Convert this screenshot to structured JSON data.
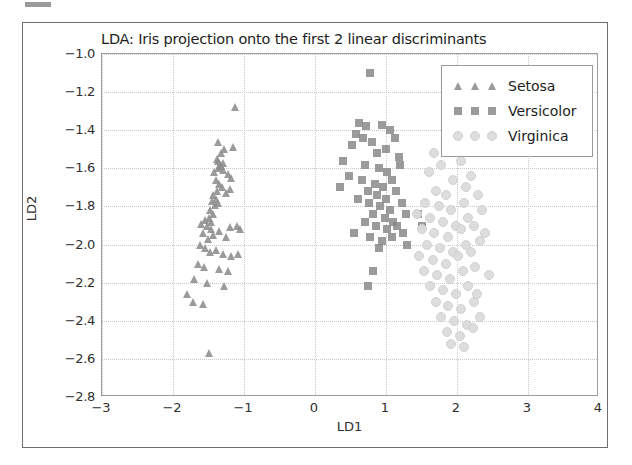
{
  "chart_data": {
    "type": "scatter",
    "title": "LDA: Iris projection onto the first 2 linear discriminants",
    "xlabel": "LD1",
    "ylabel": "LD2",
    "xlim": [
      -3,
      4
    ],
    "ylim": [
      -2.8,
      -1.0
    ],
    "xticks": [
      "-3",
      "-2",
      "-1",
      "0",
      "1",
      "2",
      "3",
      "4"
    ],
    "xtick_values": [
      -3,
      -2,
      -1,
      0,
      1,
      2,
      3,
      4
    ],
    "yticks": [
      "-1.0",
      "-1.2",
      "-1.4",
      "-1.6",
      "-1.8",
      "-2.0",
      "-2.2",
      "-2.4",
      "-2.6",
      "-2.8"
    ],
    "ytick_values": [
      -1.0,
      -1.2,
      -1.4,
      -1.6,
      -1.8,
      -2.0,
      -2.2,
      -2.4,
      -2.6,
      -2.8
    ],
    "grid": true,
    "grid_style": "dotted",
    "legend_position": "upper right",
    "series": [
      {
        "name": "Setosa",
        "marker": "triangle",
        "color": "#8d8d8d",
        "points": [
          [
            -1.33,
            -1.52
          ],
          [
            -1.28,
            -1.5
          ],
          [
            -1.15,
            -1.49
          ],
          [
            -1.38,
            -1.55
          ],
          [
            -1.36,
            -1.56
          ],
          [
            -1.3,
            -1.57
          ],
          [
            -1.34,
            -1.58
          ],
          [
            -1.32,
            -1.59
          ],
          [
            -1.37,
            -1.6
          ],
          [
            -1.29,
            -1.61
          ],
          [
            -1.22,
            -1.63
          ],
          [
            -1.18,
            -1.65
          ],
          [
            -1.42,
            -1.62
          ],
          [
            -1.4,
            -1.66
          ],
          [
            -1.35,
            -1.68
          ],
          [
            -1.31,
            -1.7
          ],
          [
            -1.38,
            -1.72
          ],
          [
            -1.43,
            -1.74
          ],
          [
            -1.39,
            -1.76
          ],
          [
            -1.45,
            -1.77
          ],
          [
            -1.41,
            -1.79
          ],
          [
            -1.36,
            -1.78
          ],
          [
            -1.26,
            -1.73
          ],
          [
            -1.2,
            -1.71
          ],
          [
            -1.48,
            -1.82
          ],
          [
            -1.44,
            -1.84
          ],
          [
            -1.5,
            -1.86
          ],
          [
            -1.46,
            -1.88
          ],
          [
            -1.52,
            -1.9
          ],
          [
            -1.47,
            -1.92
          ],
          [
            -1.55,
            -1.87
          ],
          [
            -1.6,
            -1.89
          ],
          [
            -1.43,
            -1.95
          ],
          [
            -1.51,
            -1.97
          ],
          [
            -1.58,
            -1.94
          ],
          [
            -1.35,
            -1.93
          ],
          [
            -1.2,
            -1.91
          ],
          [
            -1.1,
            -1.9
          ],
          [
            -1.05,
            -1.92
          ],
          [
            -1.25,
            -1.96
          ],
          [
            -1.62,
            -2.0
          ],
          [
            -1.55,
            -2.02
          ],
          [
            -1.48,
            -2.04
          ],
          [
            -1.4,
            -2.03
          ],
          [
            -1.3,
            -2.05
          ],
          [
            -1.18,
            -2.06
          ],
          [
            -1.08,
            -2.05
          ],
          [
            -1.65,
            -2.1
          ],
          [
            -1.57,
            -2.12
          ],
          [
            -1.35,
            -2.13
          ],
          [
            -1.22,
            -2.14
          ],
          [
            -1.7,
            -2.18
          ],
          [
            -1.52,
            -2.2
          ],
          [
            -1.28,
            -2.22
          ],
          [
            -1.8,
            -2.26
          ],
          [
            -1.72,
            -2.3
          ],
          [
            -1.58,
            -2.31
          ],
          [
            -1.12,
            -1.28
          ],
          [
            -1.5,
            -2.57
          ],
          [
            -1.36,
            -1.46
          ]
        ]
      },
      {
        "name": "Versicolor",
        "marker": "square",
        "color": "#8a8a8a",
        "points": [
          [
            0.78,
            -1.1
          ],
          [
            0.62,
            -1.36
          ],
          [
            0.72,
            -1.38
          ],
          [
            0.95,
            -1.37
          ],
          [
            0.58,
            -1.42
          ],
          [
            0.68,
            -1.44
          ],
          [
            0.8,
            -1.46
          ],
          [
            1.05,
            -1.4
          ],
          [
            1.12,
            -1.44
          ],
          [
            0.52,
            -1.48
          ],
          [
            0.88,
            -1.52
          ],
          [
            1.0,
            -1.5
          ],
          [
            1.18,
            -1.54
          ],
          [
            0.4,
            -1.56
          ],
          [
            0.7,
            -1.58
          ],
          [
            0.9,
            -1.6
          ],
          [
            1.02,
            -1.62
          ],
          [
            1.2,
            -1.58
          ],
          [
            0.48,
            -1.64
          ],
          [
            0.66,
            -1.66
          ],
          [
            0.84,
            -1.68
          ],
          [
            0.96,
            -1.7
          ],
          [
            1.08,
            -1.66
          ],
          [
            0.35,
            -1.7
          ],
          [
            0.74,
            -1.72
          ],
          [
            0.88,
            -1.74
          ],
          [
            1.0,
            -1.76
          ],
          [
            1.14,
            -1.72
          ],
          [
            0.6,
            -1.76
          ],
          [
            0.76,
            -1.78
          ],
          [
            0.92,
            -1.8
          ],
          [
            1.06,
            -1.82
          ],
          [
            1.22,
            -1.78
          ],
          [
            0.82,
            -1.84
          ],
          [
            0.98,
            -1.86
          ],
          [
            1.1,
            -1.88
          ],
          [
            1.28,
            -1.84
          ],
          [
            0.7,
            -1.88
          ],
          [
            0.86,
            -1.9
          ],
          [
            1.02,
            -1.92
          ],
          [
            1.16,
            -1.9
          ],
          [
            0.55,
            -1.94
          ],
          [
            0.78,
            -1.96
          ],
          [
            0.94,
            -1.98
          ],
          [
            1.08,
            -1.96
          ],
          [
            1.24,
            -1.94
          ],
          [
            0.9,
            -2.02
          ],
          [
            1.3,
            -2.0
          ],
          [
            0.82,
            -2.14
          ],
          [
            0.75,
            -2.22
          ],
          [
            1.45,
            -1.84
          ],
          [
            1.5,
            -1.9
          ]
        ]
      },
      {
        "name": "Virginica",
        "marker": "circle",
        "color": "#dcdcdc",
        "points": [
          [
            1.6,
            -1.62
          ],
          [
            1.78,
            -1.58
          ],
          [
            2.05,
            -1.56
          ],
          [
            1.95,
            -1.66
          ],
          [
            2.12,
            -1.7
          ],
          [
            1.7,
            -1.72
          ],
          [
            1.85,
            -1.74
          ],
          [
            2.2,
            -1.64
          ],
          [
            1.55,
            -1.78
          ],
          [
            1.74,
            -1.8
          ],
          [
            1.92,
            -1.82
          ],
          [
            2.1,
            -1.78
          ],
          [
            2.3,
            -1.74
          ],
          [
            1.62,
            -1.86
          ],
          [
            1.8,
            -1.88
          ],
          [
            1.98,
            -1.9
          ],
          [
            2.15,
            -1.86
          ],
          [
            2.35,
            -1.82
          ],
          [
            1.5,
            -1.92
          ],
          [
            1.68,
            -1.94
          ],
          [
            1.88,
            -1.96
          ],
          [
            2.05,
            -1.92
          ],
          [
            2.24,
            -1.9
          ],
          [
            1.58,
            -2.0
          ],
          [
            1.76,
            -2.02
          ],
          [
            1.94,
            -2.04
          ],
          [
            2.12,
            -2.0
          ],
          [
            2.32,
            -1.98
          ],
          [
            1.46,
            -2.06
          ],
          [
            1.66,
            -2.08
          ],
          [
            1.84,
            -2.1
          ],
          [
            2.02,
            -2.06
          ],
          [
            2.2,
            -2.04
          ],
          [
            1.54,
            -2.14
          ],
          [
            1.72,
            -2.16
          ],
          [
            1.9,
            -2.18
          ],
          [
            2.08,
            -2.14
          ],
          [
            2.26,
            -2.12
          ],
          [
            1.62,
            -2.22
          ],
          [
            1.8,
            -2.24
          ],
          [
            1.98,
            -2.26
          ],
          [
            2.16,
            -2.22
          ],
          [
            1.7,
            -2.3
          ],
          [
            1.88,
            -2.32
          ],
          [
            2.06,
            -2.34
          ],
          [
            2.24,
            -2.3
          ],
          [
            1.78,
            -2.38
          ],
          [
            1.96,
            -2.4
          ],
          [
            2.14,
            -2.42
          ],
          [
            2.32,
            -2.38
          ],
          [
            1.86,
            -2.46
          ],
          [
            2.04,
            -2.48
          ],
          [
            2.22,
            -2.44
          ],
          [
            1.68,
            -1.52
          ],
          [
            2.4,
            -1.94
          ],
          [
            2.45,
            -2.16
          ],
          [
            1.44,
            -1.84
          ],
          [
            2.1,
            -2.54
          ],
          [
            1.92,
            -2.52
          ],
          [
            2.28,
            -2.26
          ]
        ]
      }
    ]
  },
  "legend": {
    "items": [
      {
        "label": "Setosa",
        "marker": "triangle"
      },
      {
        "label": "Versicolor",
        "marker": "square"
      },
      {
        "label": "Virginica",
        "marker": "circle"
      }
    ]
  }
}
